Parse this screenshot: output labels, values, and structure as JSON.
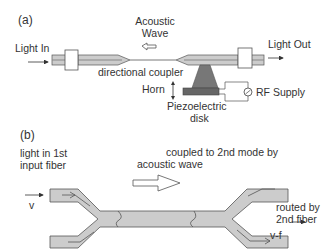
{
  "panel_a": {
    "label": "(a)",
    "light_in": "Light In",
    "light_out": "Light Out",
    "acoustic_wave_line1": "Acoustic",
    "acoustic_wave_line2": "Wave",
    "directional_coupler": "directional coupler",
    "horn": "Horn",
    "piezo_line1": "Piezoelectric",
    "piezo_line2": "disk",
    "rf_supply": "RF Supply"
  },
  "panel_b": {
    "label": "(b)",
    "input_line1": "light in 1st",
    "input_line2": "input fiber",
    "input_freq": "v",
    "coupled_line1": "coupled to 2nd mode by",
    "coupled_line2": "acoustic wave",
    "routed_line1": "routed by",
    "routed_line2": "2nd fiber",
    "output_freq": "v-f"
  },
  "colors": {
    "fiber_fill": "#cccccc",
    "fiber_stroke": "#555555",
    "horn_fill": "#777777",
    "disk_fill": "#666666",
    "text": "#333333"
  }
}
